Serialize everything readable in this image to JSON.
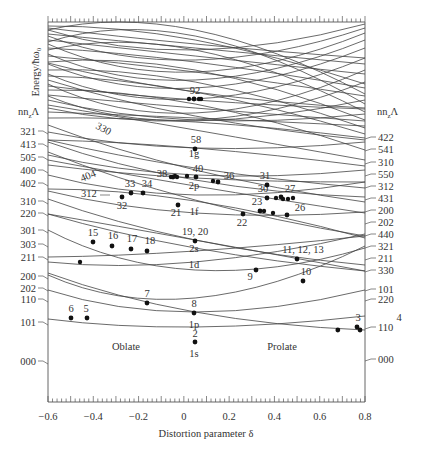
{
  "chart_data": {
    "type": "line",
    "title": "",
    "xlabel": "Distortion parameter δ",
    "ylabel": "Energy/ħω₀",
    "xlim": [
      -0.6,
      0.8
    ],
    "x_ticks": [
      "-0.6",
      "-0.4",
      "-0.2",
      "0",
      "0.2",
      "0.4",
      "0.6",
      "0.8"
    ],
    "grid": false,
    "left_axis_header": "nn_zΛ",
    "right_axis_header": "nn_zΛ",
    "region_labels": [
      "Oblate",
      "Prolate"
    ],
    "spherical_shell_labels": [
      "1s",
      "1p",
      "1d",
      "2s",
      "1f",
      "2p",
      "1g"
    ],
    "left_labels": [
      "321",
      "413",
      "505",
      "400",
      "402",
      "310",
      "220",
      "301",
      "303",
      "211",
      "200",
      "202",
      "110",
      "101",
      "000"
    ],
    "right_labels": [
      "422",
      "541",
      "310",
      "550",
      "312",
      "431",
      "200",
      "202",
      "440",
      "321",
      "211",
      "330",
      "101",
      "220",
      "110",
      "000"
    ],
    "inline_labels": [
      "330",
      "404",
      "312"
    ],
    "magic_points": [
      {
        "label": "2",
        "delta": 0.0,
        "shell": "1s"
      },
      {
        "label": "5",
        "delta": -0.44,
        "shell": "1p"
      },
      {
        "label": "6",
        "delta": -0.5,
        "shell": "1p"
      },
      {
        "label": "7",
        "delta": -0.2,
        "shell": "1p"
      },
      {
        "label": "8",
        "delta": 0.0,
        "shell": "1p"
      },
      {
        "label": "3",
        "delta": 0.5,
        "shell": "1p"
      },
      {
        "label": "4",
        "delta": 0.68,
        "shell": "1p"
      },
      {
        "label": "9",
        "delta": 0.27,
        "shell": "1d"
      },
      {
        "label": "10",
        "delta": 0.47,
        "shell": "1d"
      },
      {
        "label": "11, 12, 13",
        "delta": 0.43,
        "shell": "1d"
      },
      {
        "label": "15",
        "delta": -0.45,
        "shell": "1d"
      },
      {
        "label": "16",
        "delta": -0.36,
        "shell": "1d"
      },
      {
        "label": "17",
        "delta": -0.27,
        "shell": "1d"
      },
      {
        "label": "18",
        "delta": -0.2,
        "shell": "1d"
      },
      {
        "label": "19, 20",
        "delta": 0.0,
        "shell": "2s"
      },
      {
        "label": "21",
        "delta": -0.07,
        "shell": "1f"
      },
      {
        "label": "22",
        "delta": 0.2,
        "shell": "1f"
      },
      {
        "label": "23",
        "delta": 0.27,
        "shell": "1f"
      },
      {
        "label": "26",
        "delta": 0.37,
        "shell": "1f"
      },
      {
        "label": "27",
        "delta": 0.34,
        "shell": "1f"
      },
      {
        "label": "30",
        "delta": 0.28,
        "shell": "1f"
      },
      {
        "label": "31",
        "delta": 0.3,
        "shell": "1f"
      },
      {
        "label": "32",
        "delta": -0.31,
        "shell": "1f"
      },
      {
        "label": "33",
        "delta": -0.27,
        "shell": "1f"
      },
      {
        "label": "34",
        "delta": -0.23,
        "shell": "1f"
      },
      {
        "label": "36",
        "delta": 0.13,
        "shell": "2p"
      },
      {
        "label": "38",
        "delta": -0.09,
        "shell": "2p"
      },
      {
        "label": "40",
        "delta": 0.0,
        "shell": "2p"
      },
      {
        "label": "58",
        "delta": 0.0,
        "shell": "1g"
      },
      {
        "label": "92",
        "delta": 0.0,
        "shell": "1h/2f/3p"
      }
    ]
  },
  "axes": {
    "ylabel": "Energy/ħω₀",
    "xlabel": "Distortion parameter δ",
    "left_header": "nn",
    "left_header_sub": "z",
    "left_header_tail": "Λ",
    "right_header": "nn",
    "right_header_sub": "z",
    "right_header_tail": "Λ"
  },
  "regions": {
    "oblate": "Oblate",
    "prolate": "Prolate"
  }
}
